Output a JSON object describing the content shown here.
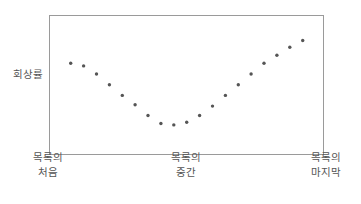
{
  "chart_data": {
    "type": "scatter",
    "title": "",
    "xlabel": "",
    "ylabel": "회상률",
    "x_tick_labels": [
      {
        "line1": "목록의",
        "line2": "처음"
      },
      {
        "line1": "목록의",
        "line2": "중간"
      },
      {
        "line1": "목록의",
        "line2": "마지막"
      }
    ],
    "grid": false,
    "legend": null,
    "x_range": [
      1,
      20
    ],
    "y_range": [
      0,
      100
    ],
    "points": [
      {
        "x": 1,
        "y": 64
      },
      {
        "x": 2,
        "y": 62
      },
      {
        "x": 3,
        "y": 56
      },
      {
        "x": 4,
        "y": 48
      },
      {
        "x": 5,
        "y": 40
      },
      {
        "x": 6,
        "y": 33
      },
      {
        "x": 7,
        "y": 25
      },
      {
        "x": 8,
        "y": 19
      },
      {
        "x": 9,
        "y": 18
      },
      {
        "x": 10,
        "y": 20
      },
      {
        "x": 11,
        "y": 25
      },
      {
        "x": 12,
        "y": 32
      },
      {
        "x": 13,
        "y": 40
      },
      {
        "x": 14,
        "y": 48
      },
      {
        "x": 15,
        "y": 56
      },
      {
        "x": 16,
        "y": 64
      },
      {
        "x": 17,
        "y": 70
      },
      {
        "x": 18,
        "y": 76
      },
      {
        "x": 19,
        "y": 81
      }
    ],
    "point_color": "#555555",
    "frame_color": "#9a9a9a"
  },
  "labels": {
    "y_axis": "회상률",
    "x_start_1": "목록의",
    "x_start_2": "처음",
    "x_mid_1": "목록의",
    "x_mid_2": "중간",
    "x_end_1": "목록의",
    "x_end_2": "마지막"
  }
}
